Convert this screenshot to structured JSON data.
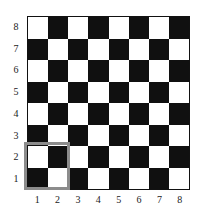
{
  "figure": {
    "kind": "chessboard-diagram",
    "background_color": "#ffffff"
  },
  "chart_data": {
    "type": "heatmap",
    "title": "",
    "subtitle": "",
    "xlabel": "",
    "ylabel": "",
    "grid": true,
    "legend_position": "none",
    "board": {
      "files": 8,
      "ranks": 8,
      "light_color": "#ffffff",
      "dark_color": "#101010",
      "border_color": "#111111",
      "top_left_square_color": "light",
      "note": "cells[r][c]: r=0 is rank 8 (top), c=0 is file 1 (left); 0 = light, 1 = dark",
      "cells": [
        [
          0,
          1,
          0,
          1,
          0,
          1,
          0,
          1
        ],
        [
          1,
          0,
          1,
          0,
          1,
          0,
          1,
          0
        ],
        [
          0,
          1,
          0,
          1,
          0,
          1,
          0,
          1
        ],
        [
          1,
          0,
          1,
          0,
          1,
          0,
          1,
          0
        ],
        [
          0,
          1,
          0,
          1,
          0,
          1,
          0,
          1
        ],
        [
          1,
          0,
          1,
          0,
          1,
          0,
          1,
          0
        ],
        [
          0,
          1,
          0,
          1,
          0,
          1,
          0,
          1
        ],
        [
          1,
          0,
          1,
          0,
          1,
          0,
          1,
          0
        ]
      ]
    },
    "x": [
      "1",
      "2",
      "3",
      "4",
      "5",
      "6",
      "7",
      "8"
    ],
    "y": [
      "8",
      "7",
      "6",
      "5",
      "4",
      "3",
      "2",
      "1"
    ],
    "xtick_labels": [
      "1",
      "2",
      "3",
      "4",
      "5",
      "6",
      "7",
      "8"
    ],
    "ytick_labels": [
      "8",
      "7",
      "6",
      "5",
      "4",
      "3",
      "2",
      "1"
    ],
    "annotations": [
      {
        "name": "highlight-box",
        "shape": "rectangle",
        "color": "#8c8c8c",
        "line_width": 3,
        "fill": "none",
        "covers_files": [
          "1",
          "2"
        ],
        "covers_ranks": [
          "1",
          "2"
        ]
      }
    ]
  },
  "labels": {
    "ranks": [
      "8",
      "7",
      "6",
      "5",
      "4",
      "3",
      "2",
      "1"
    ],
    "files": [
      "1",
      "2",
      "3",
      "4",
      "5",
      "6",
      "7",
      "8"
    ]
  },
  "colors": {
    "light_square": "#ffffff",
    "dark_square": "#101010",
    "board_border": "#111111",
    "highlight": "#8c8c8c",
    "label_text": "#1a1a1a"
  }
}
